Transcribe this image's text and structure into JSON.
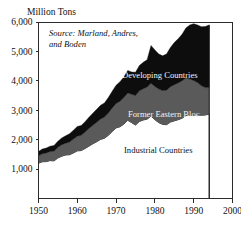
{
  "chart_data": {
    "type": "area",
    "title": "",
    "unit_label": "Million Tons",
    "xlabel": "",
    "ylabel": "Million Tons",
    "source_line1": "Source: Marland, Andres,",
    "source_line2": "and Boden",
    "source_full": "Source: Marland, Andres, and Boden",
    "stacked": true,
    "grid": false,
    "legend_position": "inline-labels",
    "xlim": [
      1950,
      2000
    ],
    "ylim": [
      0,
      6000
    ],
    "xticks": [
      1950,
      1960,
      1970,
      1980,
      1990,
      2000
    ],
    "xticklabels": [
      "1950",
      "1960",
      "1970",
      "1980",
      "1990",
      "2000"
    ],
    "yticks": [
      1000,
      2000,
      3000,
      4000,
      5000,
      6000
    ],
    "yticklabels": [
      "1,000",
      "2,000",
      "3,000",
      "4,000",
      "5,000",
      "6,000"
    ],
    "data_end_year": 1994,
    "x": [
      1950,
      1951,
      1952,
      1953,
      1954,
      1955,
      1956,
      1957,
      1958,
      1959,
      1960,
      1961,
      1962,
      1963,
      1964,
      1965,
      1966,
      1967,
      1968,
      1969,
      1970,
      1971,
      1972,
      1973,
      1974,
      1975,
      1976,
      1977,
      1978,
      1979,
      1980,
      1981,
      1982,
      1983,
      1984,
      1985,
      1986,
      1987,
      1988,
      1989,
      1990,
      1991,
      1992,
      1993,
      1994
    ],
    "series": [
      {
        "name": "Industrial Countries",
        "color": "#ffffff",
        "label_color": "#111111",
        "values": [
          1200,
          1250,
          1255,
          1290,
          1280,
          1380,
          1440,
          1480,
          1490,
          1550,
          1620,
          1630,
          1700,
          1780,
          1860,
          1930,
          2010,
          2050,
          2150,
          2280,
          2400,
          2440,
          2530,
          2660,
          2580,
          2500,
          2620,
          2670,
          2700,
          2800,
          2680,
          2580,
          2520,
          2510,
          2600,
          2640,
          2680,
          2730,
          2820,
          2830,
          2830,
          2840,
          2830,
          2840,
          2870
        ]
      },
      {
        "name": "Former Eastern Bloc",
        "color": "#5a5a5a",
        "label_color": "#f2f2f2",
        "values": [
          250,
          270,
          290,
          310,
          330,
          360,
          390,
          400,
          430,
          470,
          500,
          520,
          560,
          600,
          630,
          660,
          690,
          720,
          760,
          800,
          830,
          870,
          900,
          930,
          960,
          1000,
          1040,
          1060,
          1090,
          1120,
          1130,
          1140,
          1150,
          1170,
          1200,
          1230,
          1250,
          1270,
          1280,
          1230,
          1180,
          1100,
          1000,
          930,
          900
        ]
      },
      {
        "name": "Developing Countries",
        "color": "#0d0d0d",
        "label_color": "#f2f2f2",
        "values": [
          150,
          160,
          170,
          180,
          190,
          210,
          230,
          250,
          280,
          300,
          330,
          330,
          350,
          380,
          410,
          440,
          470,
          480,
          520,
          570,
          620,
          660,
          700,
          760,
          760,
          790,
          860,
          900,
          930,
          1280,
          1240,
          1190,
          1180,
          1230,
          1330,
          1430,
          1500,
          1580,
          1700,
          1840,
          1930,
          1960,
          2010,
          2080,
          2130
        ]
      }
    ],
    "totals": [
      1600,
      1680,
      1715,
      1780,
      1800,
      1950,
      2060,
      2130,
      2200,
      2320,
      2450,
      2480,
      2610,
      2760,
      2900,
      3030,
      3170,
      3250,
      3430,
      3650,
      3850,
      3970,
      4130,
      4350,
      4300,
      4290,
      4520,
      4630,
      4720,
      5200,
      5050,
      4910,
      4850,
      4910,
      5130,
      5300,
      5430,
      5580,
      5800,
      5900,
      5940,
      5900,
      5840,
      5850,
      5900
    ]
  },
  "labels": {
    "developing": "Developing Countries",
    "eastern_bloc": "Former Eastern Bloc",
    "industrial": "Industrial Countries"
  }
}
